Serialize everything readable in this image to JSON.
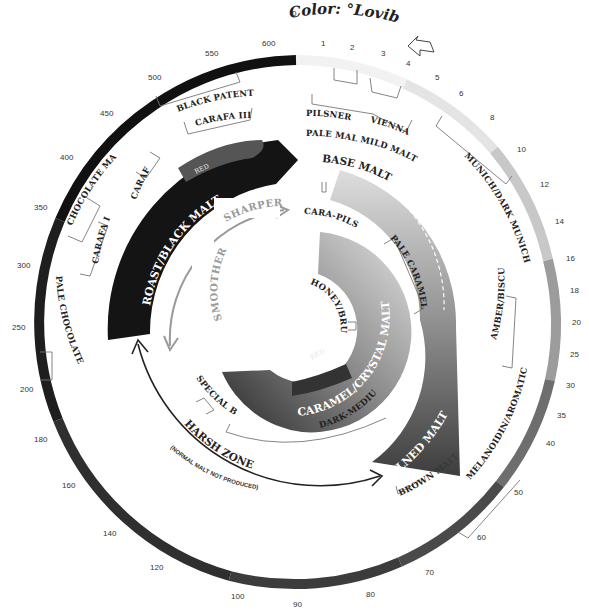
{
  "title": "Color: °Lovibond",
  "scale": {
    "ticks": [
      "0",
      "1",
      "2",
      "3",
      "4",
      "5",
      "6",
      "8",
      "10",
      "12",
      "14",
      "16",
      "18",
      "20",
      "25",
      "30",
      "35",
      "40",
      "50",
      "60",
      "70",
      "80",
      "90",
      "100",
      "120",
      "140",
      "160",
      "180",
      "200",
      "250",
      "300",
      "350",
      "400",
      "450",
      "500",
      "550",
      "600"
    ]
  },
  "outer_labels": {
    "pilsner": "PILSNER",
    "vienna": "VIENNA",
    "pale_malt": "PALE MALT",
    "mild_malt": "MILD MALT",
    "munich": "MUNICH/DARK MUNICH",
    "amber": "AMBER/BISCUIT",
    "melanoidin": "MELANOIDIN/AROMATIC",
    "brown_malt": "BROWN MALT",
    "pale_chocolate": "PALE CHOCOLATE",
    "carafa_i": "CARAFA I",
    "chocolate_malt": "CHOCOLATE MALT",
    "carafa_ii": "CARAFA II",
    "carafa_iii": "CARAFA III",
    "black_patent": "BLACK PATENT"
  },
  "bands": {
    "base_malt": "BASE MALT",
    "kilned_malt": "KILNED MALT",
    "roast_black": "ROAST/BLACK MALT",
    "roast_red": "RED",
    "caramel_crystal": "CARAMEL/CRYSTAL MALTS",
    "caramel_red": "RED"
  },
  "inner_labels": {
    "cara_pils": "CARA-PILS",
    "pale_caramel": "PALE CARAMEL",
    "honey": "HONEY/BRUMALT",
    "dark_medium": "DARK-MEDIUM",
    "special_b": "SPECIAL B"
  },
  "flavor": {
    "sharper": "SHARPER",
    "smoother": "SMOOTHER"
  },
  "harsh_zone": {
    "label": "HARSH ZONE",
    "note": "(NORMAL MALT NOT PRODUCED)"
  },
  "colors": {
    "dark": "#1a1a1a",
    "mid": "#555555",
    "light": "#e6e6e6",
    "arrow_grey": "#9a9a9a"
  }
}
